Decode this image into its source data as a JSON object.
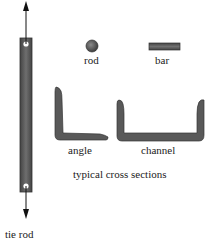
{
  "diagram": {
    "title": "typical cross sections",
    "tie_rod": {
      "label": "tie rod"
    },
    "cross_sections": [
      {
        "id": "rod",
        "label": "rod"
      },
      {
        "id": "bar",
        "label": "bar"
      },
      {
        "id": "angle",
        "label": "angle"
      },
      {
        "id": "channel",
        "label": "channel"
      }
    ],
    "colors": {
      "member_fill": "#5a5a5a",
      "member_edge": "#3a3a3a",
      "arrow": "#111111",
      "hole": "#ffffff",
      "text": "#222222"
    }
  }
}
